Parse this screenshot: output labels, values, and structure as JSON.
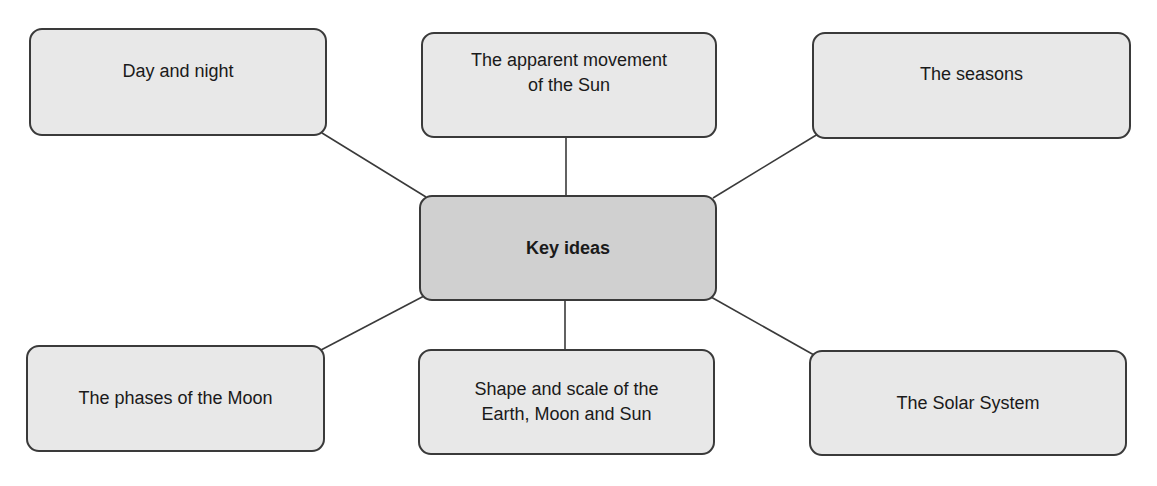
{
  "diagram": {
    "type": "mind-map",
    "center": {
      "label": "Key ideas"
    },
    "nodes": [
      {
        "id": "day-night",
        "label": "Day and night"
      },
      {
        "id": "sun-movement",
        "label": "The apparent movement of the Sun"
      },
      {
        "id": "seasons",
        "label": "The seasons"
      },
      {
        "id": "moon-phases",
        "label": "The phases of the Moon"
      },
      {
        "id": "shape-scale",
        "label": "Shape and scale of the Earth, Moon and Sun"
      },
      {
        "id": "solar-system",
        "label": "The Solar System"
      }
    ],
    "colors": {
      "node_fill": "#e8e8e8",
      "center_fill": "#d0d0d0",
      "border": "#3a3a3a",
      "connector": "#3a3a3a"
    }
  }
}
